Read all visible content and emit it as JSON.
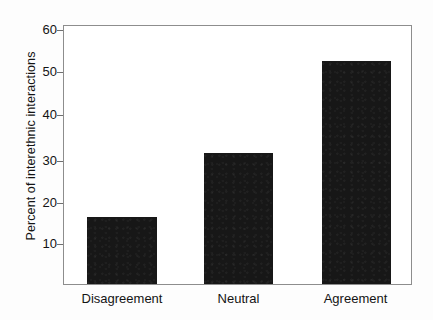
{
  "chart_data": {
    "type": "bar",
    "title": "",
    "subtitle": "",
    "xlabel": "",
    "ylabel": "Percent of interethnic interactions",
    "categories": [
      "Disagreement",
      "Neutral",
      "Agreement"
    ],
    "values": [
      16.0,
      31.5,
      53.5
    ],
    "series": [
      {
        "name": "Percent of interethnic interactions",
        "values": [
          16.0,
          31.5,
          53.5
        ]
      }
    ],
    "ylim": [
      0,
      62
    ],
    "yticks": [
      10,
      20,
      30,
      40,
      50,
      60
    ],
    "ytick_labels": [
      "10",
      "20",
      "30",
      "40",
      "50",
      "60"
    ],
    "grid": false,
    "legend": null,
    "legend_position": "none",
    "bar_color": "#171717",
    "frame_color": "#8d8d8d",
    "background_color": "#ffffff",
    "annotations": []
  },
  "figure": {
    "axis_label_vertical": "Percent of interethnic interactions"
  }
}
